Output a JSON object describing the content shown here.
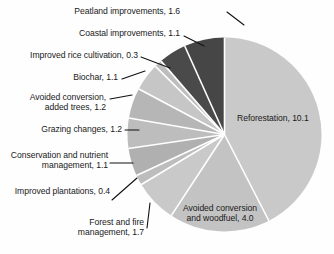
{
  "chart_data": {
    "type": "pie",
    "title": "",
    "subtitle": "",
    "units": "GtCO2e per year",
    "total": 23.8,
    "legend_position": "labels-with-leader-lines",
    "grid": false,
    "start_angle_deg": 0,
    "direction": "clockwise",
    "categories": [
      "Reforestation",
      "Avoided conversion and woodfuel",
      "Forest and fire management",
      "Improved plantations",
      "Conservation and nutrient management",
      "Grazing changes",
      "Avoided conversion, added trees",
      "Biochar",
      "Improved rice cultivation",
      "Coastal improvements",
      "Peatland improvements"
    ],
    "values": [
      10.1,
      4.0,
      1.7,
      0.4,
      1.1,
      1.2,
      1.2,
      1.1,
      0.3,
      1.1,
      1.6
    ],
    "slices": [
      {
        "name": "Reforestation",
        "value": 10.1,
        "label": "Reforestation, 10.1",
        "color": "#c9c9c9",
        "label_placement": "inside",
        "leader": false
      },
      {
        "name": "Avoided conversion and woodfuel",
        "value": 4.0,
        "label": "Avoided conversion\nand woodfuel, 4.0",
        "label_line1": "Avoided conversion",
        "label_line2": "and woodfuel, 4.0",
        "color": "#c3c3c3",
        "label_placement": "inside",
        "leader": false
      },
      {
        "name": "Forest and fire management",
        "value": 1.7,
        "label": "Forest and fire\nmanagement, 1.7",
        "label_line1": "Forest and fire",
        "label_line2": "management, 1.7",
        "color": "#c9c9c9",
        "label_placement": "outside",
        "leader": true
      },
      {
        "name": "Improved plantations",
        "value": 0.4,
        "label": "Improved plantations, 0.4",
        "color": "#bdbdbd",
        "label_placement": "outside",
        "leader": true
      },
      {
        "name": "Conservation and nutrient management",
        "value": 1.1,
        "label": "Conservation and nutrient\nmanagement, 1.1",
        "label_line1": "Conservation and nutrient",
        "label_line2": "management, 1.1",
        "color": "#b0b0b0",
        "label_placement": "outside",
        "leader": true
      },
      {
        "name": "Grazing changes",
        "value": 1.2,
        "label": "Grazing changes, 1.2",
        "color": "#bdbdbd",
        "label_placement": "outside",
        "leader": true
      },
      {
        "name": "Avoided conversion, added trees",
        "value": 1.2,
        "label": "Avoided conversion,\nadded trees, 1.2",
        "label_line1": "Avoided conversion,",
        "label_line2": "added trees, 1.2",
        "color": "#b6b6b6",
        "label_placement": "outside",
        "leader": true
      },
      {
        "name": "Biochar",
        "value": 1.1,
        "label": "Biochar, 1.1",
        "color": "#c6c6c6",
        "label_placement": "outside",
        "leader": true
      },
      {
        "name": "Improved rice cultivation",
        "value": 0.3,
        "label": "Improved rice cultivation, 0.3",
        "color": "#bdbdbd",
        "label_placement": "outside",
        "leader": true
      },
      {
        "name": "Coastal improvements",
        "value": 1.1,
        "label": "Coastal improvements, 1.1",
        "color": "#4a4a4a",
        "label_placement": "outside",
        "leader": true
      },
      {
        "name": "Peatland improvements",
        "value": 1.6,
        "label": "Peatland improvements, 1.6",
        "color": "#464646",
        "label_placement": "outside",
        "leader": true
      }
    ],
    "geometry": {
      "center_x": 224.5,
      "center_y": 134.5,
      "radius": 97,
      "separator_color": "#ffffff",
      "separator_width": 1.6
    }
  },
  "labels": {
    "peatland": "Peatland improvements, 1.6",
    "coastal": "Coastal improvements, 1.1",
    "rice": "Improved rice cultivation, 0.3",
    "biochar": "Biochar, 1.1",
    "avoided_added_trees_l1": "Avoided conversion,",
    "avoided_added_trees_l2": "added trees, 1.2",
    "grazing": "Grazing changes, 1.2",
    "conservation_l1": "Conservation and nutrient",
    "conservation_l2": "management, 1.1",
    "plantations": "Improved plantations, 0.4",
    "forest_fire_l1": "Forest and fire",
    "forest_fire_l2": "management, 1.7",
    "reforestation": "Reforestation, 10.1",
    "avoided_woodfuel_l1": "Avoided conversion",
    "avoided_woodfuel_l2": "and woodfuel, 4.0"
  }
}
